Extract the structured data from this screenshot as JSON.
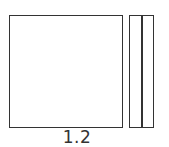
{
  "drawing": {
    "front_view": {
      "shape": "square"
    },
    "side_view": {
      "shape": "rectangle",
      "divisions": 2
    },
    "dimension_label": "1.2",
    "line_color": "#333333"
  }
}
